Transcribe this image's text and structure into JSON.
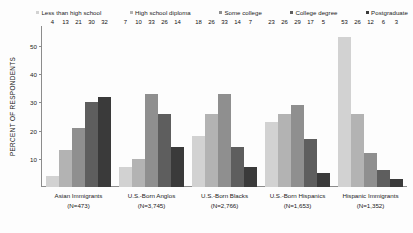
{
  "chart_data": {
    "type": "bar",
    "title": "",
    "xlabel": "",
    "ylabel": "PERCENT OF RESPONDENTS",
    "ylim": [
      0,
      57
    ],
    "yticks": [
      10,
      20,
      30,
      40,
      50
    ],
    "grid": false,
    "legend_position": "top",
    "categories": [
      "Asian Immigrants",
      "U.S.-Born Anglos",
      "U.S.-Born Blacks",
      "U.S.-Born Hispanics",
      "Hispanic Immigrants"
    ],
    "category_sublabels": [
      "(N=473)",
      "(N=3,745)",
      "(N=2,766)",
      "(N=1,653)",
      "(N=1,352)"
    ],
    "series": [
      {
        "name": "Less than high school",
        "color": "#d2d2d2",
        "values": [
          4,
          7,
          18,
          23,
          53
        ]
      },
      {
        "name": "High school diploma",
        "color": "#b3b3b3",
        "values": [
          13,
          10,
          26,
          26,
          26
        ]
      },
      {
        "name": "Some college",
        "color": "#8f8f8f",
        "values": [
          21,
          33,
          33,
          29,
          12
        ]
      },
      {
        "name": "College degree",
        "color": "#5e5e5e",
        "values": [
          30,
          26,
          14,
          17,
          6
        ]
      },
      {
        "name": "Postgraduate",
        "color": "#3a3a3a",
        "values": [
          32,
          14,
          7,
          5,
          3
        ]
      }
    ]
  }
}
